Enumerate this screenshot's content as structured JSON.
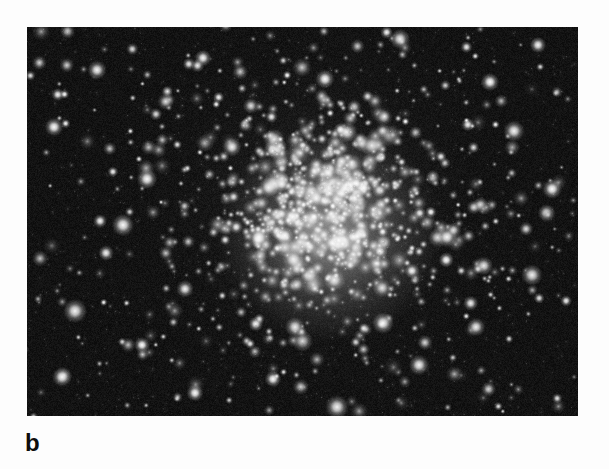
{
  "figure": {
    "panel_label": "b",
    "caption": "",
    "media_type": "monochrome astronomical photograph",
    "page_background_color": "#fdfdfd",
    "plate": {
      "background_color": "#0a0a0a",
      "star_color": "#ffffff",
      "x": 27,
      "y": 27,
      "width": 551,
      "height": 389
    },
    "cluster": {
      "core_center_x": 298,
      "core_center_y": 178,
      "core_radius": 52,
      "halo_radius": 150,
      "field_radius": 330
    }
  },
  "chart_data": {
    "type": "scatter",
    "title": "",
    "xlabel": "",
    "ylabel": "",
    "xlim": [
      0,
      551
    ],
    "ylim": [
      0,
      389
    ],
    "grid": false,
    "legend": "none",
    "series": [
      {
        "name": "core-stars",
        "count": 430,
        "center": [
          298,
          178
        ],
        "sigma": 46,
        "radius_range": [
          1.2,
          4.4
        ],
        "brightness_range": [
          0.65,
          1.0
        ]
      },
      {
        "name": "halo-stars",
        "count": 560,
        "center": [
          298,
          178
        ],
        "sigma": 118,
        "radius_range": [
          1.0,
          3.6
        ],
        "brightness_range": [
          0.42,
          0.96
        ]
      },
      {
        "name": "field-stars",
        "count": 520,
        "center": [
          275,
          195
        ],
        "sigma": 340,
        "radius_range": [
          0.9,
          3.9
        ],
        "brightness_range": [
          0.3,
          1.0
        ]
      }
    ]
  }
}
